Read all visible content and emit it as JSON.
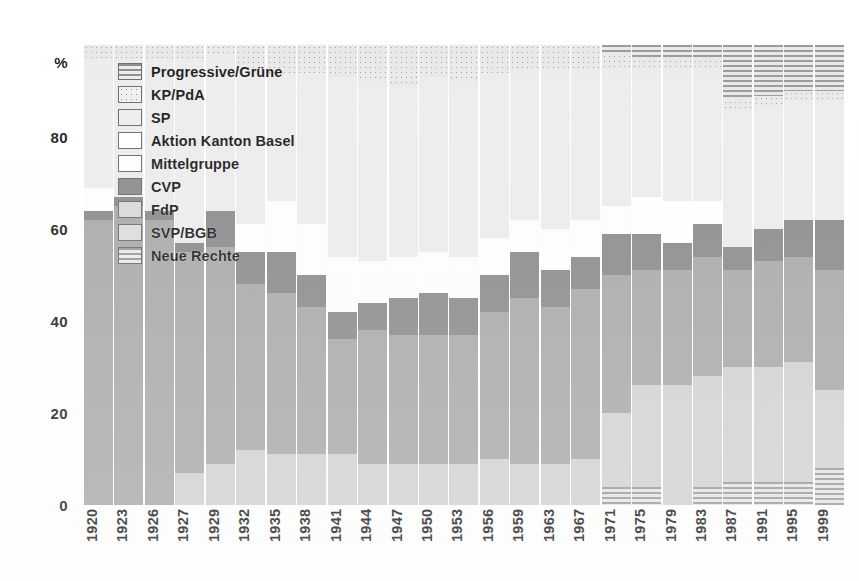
{
  "chart_data": {
    "type": "bar",
    "subtype": "stacked-100-percent",
    "title": "",
    "xlabel": "",
    "ylabel": "%",
    "ylim": [
      0,
      100
    ],
    "yticks": [
      0,
      20,
      40,
      60,
      80
    ],
    "ytick_labels": [
      "0",
      "20",
      "40",
      "60",
      "80"
    ],
    "y_axis_unit_label": "%",
    "grid": false,
    "legend_position": "top-left-inside",
    "categories": [
      "1920",
      "1923",
      "1926",
      "1927",
      "1929",
      "1932",
      "1935",
      "1938",
      "1941",
      "1944",
      "1947",
      "1950",
      "1953",
      "1956",
      "1959",
      "1963",
      "1967",
      "1971",
      "1975",
      "1979",
      "1983",
      "1987",
      "1991",
      "1995",
      "1999"
    ],
    "series": [
      {
        "name": "Neue Rechte",
        "key": "neuerechte",
        "color": "#9a9a9a",
        "pattern": "horizontal-stripes",
        "values": [
          0,
          0,
          0,
          0,
          0,
          0,
          0,
          0,
          0,
          0,
          0,
          0,
          0,
          0,
          0,
          0,
          0,
          4,
          4,
          0,
          4,
          5,
          5,
          5,
          8
        ]
      },
      {
        "name": "SVP/BGB",
        "key": "svp",
        "color": "#d2d2d2",
        "pattern": "solid",
        "values": [
          0,
          0,
          0,
          7,
          9,
          12,
          11,
          11,
          11,
          9,
          9,
          9,
          9,
          10,
          9,
          9,
          10,
          16,
          22,
          26,
          24,
          25,
          25,
          26,
          17
        ]
      },
      {
        "name": "FdP",
        "key": "fdp",
        "color": "#a9a9a9",
        "pattern": "solid",
        "values": [
          62,
          65,
          62,
          48,
          47,
          36,
          35,
          32,
          25,
          29,
          28,
          28,
          28,
          32,
          36,
          34,
          37,
          30,
          25,
          25,
          26,
          21,
          23,
          23,
          26
        ]
      },
      {
        "name": "CVP",
        "key": "cvp",
        "color": "#8b8b8b",
        "pattern": "solid",
        "values": [
          2,
          2,
          2,
          2,
          8,
          7,
          9,
          7,
          6,
          6,
          8,
          9,
          8,
          8,
          10,
          8,
          7,
          9,
          8,
          6,
          7,
          5,
          7,
          8,
          11
        ]
      },
      {
        "name": "Mittelgruppe",
        "key": "mittel",
        "color": "#fdfdfd",
        "pattern": "white",
        "values": [
          5,
          0,
          0,
          0,
          0,
          6,
          11,
          11,
          12,
          9,
          9,
          9,
          9,
          8,
          7,
          9,
          8,
          6,
          0,
          0,
          0,
          0,
          0,
          0,
          0
        ]
      },
      {
        "name": "Aktion Kanton Basel",
        "key": "akb",
        "color": "#ffffff",
        "pattern": "white",
        "values": [
          0,
          0,
          0,
          0,
          0,
          0,
          0,
          0,
          0,
          0,
          0,
          0,
          0,
          0,
          0,
          0,
          0,
          0,
          8,
          9,
          5,
          0,
          0,
          0,
          0
        ]
      },
      {
        "name": "SP",
        "key": "sp",
        "color": "#ececec",
        "pattern": "light-solid",
        "values": [
          28,
          30,
          33,
          40,
          34,
          34,
          28,
          33,
          39,
          39,
          37,
          38,
          38,
          36,
          33,
          35,
          33,
          30,
          28,
          29,
          29,
          30,
          27,
          26,
          26
        ]
      },
      {
        "name": "KP/PdA",
        "key": "kp",
        "color": "#e9e9e9",
        "pattern": "dots",
        "values": [
          3,
          3,
          3,
          3,
          2,
          5,
          6,
          6,
          7,
          8,
          9,
          7,
          8,
          6,
          5,
          5,
          5,
          3,
          2,
          2,
          2,
          2,
          2,
          2,
          2
        ]
      },
      {
        "name": "Progressive/Grüne",
        "key": "prog",
        "color": "#9a9a9a",
        "pattern": "horizontal-stripes",
        "values": [
          0,
          0,
          0,
          0,
          0,
          0,
          0,
          0,
          0,
          0,
          0,
          0,
          0,
          0,
          0,
          0,
          0,
          2,
          3,
          3,
          3,
          12,
          11,
          10,
          10
        ]
      }
    ]
  },
  "legend": {
    "items": [
      {
        "label": "Progressive/Grüne",
        "swatch": "lg-prog"
      },
      {
        "label": "KP/PdA",
        "swatch": "lg-kp"
      },
      {
        "label": "SP",
        "swatch": "lg-sp"
      },
      {
        "label": "Aktion Kanton Basel",
        "swatch": "lg-akb"
      },
      {
        "label": "Mittelgruppe",
        "swatch": "lg-mittel"
      },
      {
        "label": "CVP",
        "swatch": "lg-cvp"
      },
      {
        "label": "FdP",
        "swatch": "lg-fdp"
      },
      {
        "label": "SVP/BGB",
        "swatch": "lg-svp"
      },
      {
        "label": "Neue Rechte",
        "swatch": "lg-neue"
      }
    ]
  }
}
